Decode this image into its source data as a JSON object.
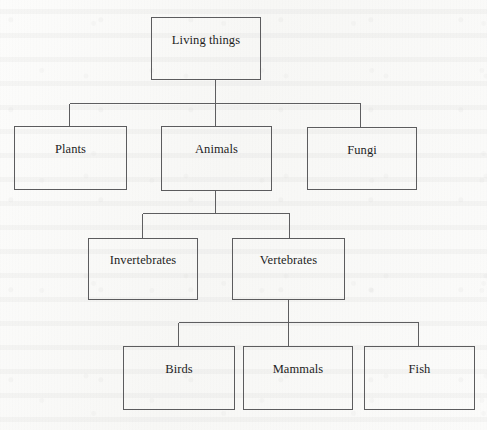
{
  "diagram": {
    "type": "tree",
    "orientation": "top-down",
    "style": {
      "page_background": "#fbfbf9",
      "box_border_color": "#5c5c5e",
      "connector_color": "#5e5e60",
      "text_color": "#1d1d1d"
    },
    "levels": [
      {
        "level": 1,
        "node_ids": [
          "living-things"
        ]
      },
      {
        "level": 2,
        "node_ids": [
          "plants",
          "animals",
          "fungi"
        ]
      },
      {
        "level": 3,
        "node_ids": [
          "invertebrates",
          "vertebrates"
        ]
      },
      {
        "level": 4,
        "node_ids": [
          "birds",
          "mammals",
          "fish"
        ]
      }
    ],
    "nodes": [
      {
        "id": "living-things",
        "label": "Living things",
        "level": 1,
        "parent": null,
        "x": 151,
        "y": 17,
        "w": 110,
        "h": 63
      },
      {
        "id": "plants",
        "label": "Plants",
        "level": 2,
        "parent": "living-things",
        "x": 14,
        "y": 126,
        "w": 113,
        "h": 64
      },
      {
        "id": "animals",
        "label": "Animals",
        "level": 2,
        "parent": "living-things",
        "x": 161,
        "y": 126,
        "w": 111,
        "h": 65
      },
      {
        "id": "fungi",
        "label": "Fungi",
        "level": 2,
        "parent": "living-things",
        "x": 307,
        "y": 127,
        "w": 110,
        "h": 63
      },
      {
        "id": "invertebrates",
        "label": "Invertebrates",
        "level": 3,
        "parent": "animals",
        "x": 88,
        "y": 238,
        "w": 110,
        "h": 62
      },
      {
        "id": "vertebrates",
        "label": "Vertebrates",
        "level": 3,
        "parent": "animals",
        "x": 232,
        "y": 238,
        "w": 113,
        "h": 62
      },
      {
        "id": "birds",
        "label": "Birds",
        "level": 4,
        "parent": "vertebrates",
        "x": 123,
        "y": 346,
        "w": 112,
        "h": 64
      },
      {
        "id": "mammals",
        "label": "Mammals",
        "level": 4,
        "parent": "vertebrates",
        "x": 243,
        "y": 346,
        "w": 110,
        "h": 64
      },
      {
        "id": "fish",
        "label": "Fish",
        "level": 4,
        "parent": "vertebrates",
        "x": 364,
        "y": 346,
        "w": 111,
        "h": 64
      }
    ],
    "edges": [
      {
        "from": "living-things",
        "to": "plants"
      },
      {
        "from": "living-things",
        "to": "animals"
      },
      {
        "from": "living-things",
        "to": "fungi"
      },
      {
        "from": "animals",
        "to": "invertebrates"
      },
      {
        "from": "animals",
        "to": "vertebrates"
      },
      {
        "from": "vertebrates",
        "to": "birds"
      },
      {
        "from": "vertebrates",
        "to": "mammals"
      },
      {
        "from": "vertebrates",
        "to": "fish"
      }
    ]
  }
}
